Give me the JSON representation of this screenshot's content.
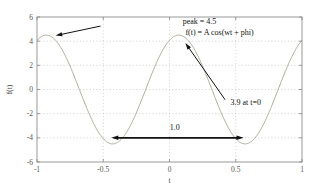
{
  "chart_data": {
    "type": "line",
    "title": "",
    "xlabel": "t",
    "ylabel": "f(t)",
    "xlim": [
      -1,
      1
    ],
    "ylim": [
      -6,
      6
    ],
    "xticks": [
      "-1",
      "-0.5",
      "0",
      "0.5",
      "1"
    ],
    "xtick_values": [
      -1,
      -0.5,
      0,
      0.5,
      1
    ],
    "yticks": [
      "6",
      "4",
      "2",
      "0",
      "-2",
      "-4",
      "-6"
    ],
    "ytick_values": [
      6,
      4,
      2,
      0,
      -2,
      -4,
      -6
    ],
    "grid": true,
    "grid_style": "dotted",
    "legend": "none",
    "series": [
      {
        "name": "f(t) = A cos(wt + phi)",
        "color": "#9b9b86",
        "amplitude": 4.5,
        "frequency_hz": 1.0,
        "period": 1.0,
        "phase_rad": -0.44,
        "value_at_t0": 3.9,
        "peak": 4.5,
        "x": [
          -1.0,
          -0.95,
          -0.9,
          -0.85,
          -0.8,
          -0.75,
          -0.7,
          -0.65,
          -0.6,
          -0.55,
          -0.5,
          -0.45,
          -0.43,
          -0.4,
          -0.35,
          -0.3,
          -0.25,
          -0.2,
          -0.15,
          -0.1,
          -0.05,
          0.0,
          0.07,
          0.1,
          0.15,
          0.2,
          0.25,
          0.3,
          0.35,
          0.4,
          0.45,
          0.5,
          0.55,
          0.57,
          0.6,
          0.65,
          0.7,
          0.75,
          0.8,
          0.85,
          0.9,
          0.95,
          1.0
        ],
        "y": [
          4.07,
          4.37,
          4.49,
          4.43,
          4.19,
          3.78,
          3.22,
          2.53,
          1.74,
          0.89,
          0.0,
          -0.89,
          -1.23,
          -1.74,
          -2.53,
          -3.22,
          -3.78,
          -4.19,
          -4.43,
          -4.49,
          -4.37,
          -4.07,
          -3.9,
          -3.6,
          -3.0,
          -2.28,
          -1.46,
          -0.58,
          0.32,
          1.2,
          2.05,
          2.8,
          3.45,
          3.64,
          3.96,
          4.31,
          4.48,
          4.46,
          4.25,
          3.86,
          3.31,
          2.64,
          1.86
        ]
      }
    ],
    "annotations": [
      {
        "id": "peak-annotation",
        "text": "peak = 4.5",
        "text_x": 0.1,
        "text_y": 5.45,
        "arrow_from_x": -0.52,
        "arrow_from_y": 5.25,
        "arrow_to_x": -0.86,
        "arrow_to_y": 4.46
      },
      {
        "id": "formula-annotation",
        "text": "f(t) = A cos(wt + phi)",
        "text_x": 0.12,
        "text_y": 4.5
      },
      {
        "id": "value-at-zero-annotation",
        "text": "3.9 at t=0",
        "text_x": 0.46,
        "text_y": -1.25,
        "arrow_from_x": 0.42,
        "arrow_from_y": -0.85,
        "arrow_to_x": 0.12,
        "arrow_to_y": 3.85
      },
      {
        "id": "period-annotation",
        "text": "1.0",
        "text_x": 0.04,
        "text_y": -3.35,
        "arrow_left_x": -0.44,
        "arrow_right_x": 0.56,
        "arrow_y": -4.0,
        "style": "double-headed"
      }
    ]
  },
  "colors": {
    "curve": "#9b9b86",
    "frame": "#8f8f8f",
    "grid": "#b9b9b9",
    "annotation": "#111111",
    "tick_text": "#555555",
    "background": "#ffffff"
  }
}
